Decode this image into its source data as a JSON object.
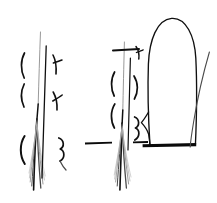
{
  "document": {
    "kind": "line-art-diagram",
    "technique": "pen-and-ink hand drawing",
    "background_color": "#ffffff",
    "ink_color": "#101010",
    "soft_ink_color": "#4a4a4a",
    "faint_ink_color": "#8d8d8d",
    "wisp_ink_color": "#b4b4b4",
    "width": 217,
    "height": 203,
    "has_text_labels": false,
    "caption": ""
  },
  "figures": [
    {
      "id": "left-figure",
      "name": "tapering-fiber-bundle-left",
      "description": "A long vertical shaft that splays downward into a dense tapering brush of fine converging fibers, flanked by curved bracket marks on both sides.",
      "shaft": {
        "top_x": 40,
        "top_y": 32,
        "waist_x": 37,
        "waist_y": 118,
        "tip_x": 34,
        "tip_y": 190
      },
      "left_marks": [
        {
          "name": "left-bracket-upper",
          "shape": "open-paren",
          "x": 22,
          "y": 62
        },
        {
          "name": "left-bracket-middle",
          "shape": "open-paren",
          "x": 22,
          "y": 92
        },
        {
          "name": "left-bracket-lower",
          "shape": "open-paren",
          "x": 21,
          "y": 146
        }
      ],
      "right_marks": [
        {
          "name": "right-branch-upper",
          "shape": "y-branch",
          "x": 56,
          "y": 63
        },
        {
          "name": "right-branch-middle",
          "shape": "x-cross",
          "x": 56,
          "y": 99
        },
        {
          "name": "right-branch-lower",
          "shape": "s-curl",
          "x": 62,
          "y": 147
        }
      ],
      "fiber_count": 9
    },
    {
      "id": "middle-figure",
      "name": "tapering-fiber-bundle-middle",
      "description": "A second vertical shaft splaying into a tapering brush of fibers, crossed by a horizontal tick bar near the top and a long horizontal baseline near the bottom.",
      "shaft": {
        "top_x": 124,
        "top_y": 42,
        "waist_x": 122,
        "waist_y": 122,
        "tip_x": 120,
        "tip_y": 190
      },
      "top_bar": {
        "name": "upper-horizontal-tick",
        "x1": 113,
        "x2": 139,
        "y": 50
      },
      "baseline_left": {
        "name": "baseline-segment-left",
        "x1": 85,
        "x2": 112,
        "y": 143
      },
      "baseline_right": {
        "name": "baseline-segment-right",
        "x1": 133,
        "x2": 148,
        "y": 143
      },
      "left_marks": [
        {
          "name": "left-bracket-upper",
          "shape": "open-paren",
          "x": 113,
          "y": 80
        },
        {
          "name": "left-bracket-lower",
          "shape": "open-paren",
          "x": 113,
          "y": 112
        }
      ],
      "right_marks": [
        {
          "name": "right-hook-top",
          "shape": "y-branch",
          "x": 138,
          "y": 52
        },
        {
          "name": "right-bracket-upper",
          "shape": "close-paren",
          "x": 137,
          "y": 86
        },
        {
          "name": "right-bracket-lower",
          "shape": "s-curl",
          "x": 139,
          "y": 126
        }
      ],
      "fiber_count": 9
    },
    {
      "id": "right-figure",
      "name": "dome-outline",
      "description": "A large tall dome or tongue-shaped closed outline with a rounded arch top, a notched indentation on the lower left flank, and a thick solid horizontal baseline sealing the bottom.",
      "dome": {
        "apex_x": 172,
        "apex_y": 18,
        "left_x": 148,
        "right_x": 196,
        "base_y": 146
      },
      "notch": {
        "name": "left-flank-notch",
        "x": 147,
        "y": 122
      },
      "baseline": {
        "name": "dome-baseline",
        "x1": 143,
        "x2": 196,
        "y": 146,
        "thickness": 3
      },
      "trailing_curve": {
        "name": "trailing-arc",
        "start_x": 209,
        "start_y": 52,
        "end_x": 190,
        "end_y": 148
      }
    }
  ]
}
